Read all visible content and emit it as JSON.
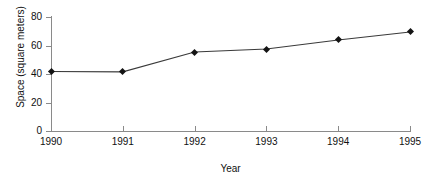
{
  "chart_data": {
    "type": "line",
    "title": "",
    "xlabel": "Year",
    "ylabel": "Space (square meters)",
    "categories": [
      "1990",
      "1991",
      "1992",
      "1993",
      "1994",
      "1995"
    ],
    "x": [
      1990,
      1991,
      1992,
      1993,
      1994,
      1995
    ],
    "values": [
      41.8,
      41.5,
      55.4,
      57.5,
      63.9,
      69.5
    ],
    "series": [
      {
        "name": "Space",
        "values": [
          41.8,
          41.5,
          55.4,
          57.5,
          63.9,
          69.5
        ]
      }
    ],
    "xlim": [
      1990,
      1995
    ],
    "ylim": [
      0,
      80
    ],
    "yticks": [
      0,
      20,
      40,
      60,
      80
    ],
    "xticks": [
      "1990",
      "1991",
      "1992",
      "1993",
      "1994",
      "1995"
    ],
    "ytick_labels": [
      "0",
      "20",
      "40",
      "60",
      "80"
    ],
    "grid": false,
    "legend": false,
    "legend_position": "none",
    "marker": "diamond",
    "line_color": "#3a3a3a",
    "marker_color": "#141414",
    "axis_color": "#8a8a8a",
    "background": "#ffffff"
  }
}
